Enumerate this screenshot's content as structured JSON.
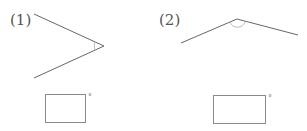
{
  "problems": [
    {
      "label": "(1)",
      "degree_symbol": "°",
      "answer_value": ""
    },
    {
      "label": "(2)",
      "degree_symbol": "°",
      "answer_value": ""
    }
  ],
  "colors": {
    "line": "#666666",
    "arc": "#bbbbbb",
    "box_border": "#8a8a8a"
  }
}
